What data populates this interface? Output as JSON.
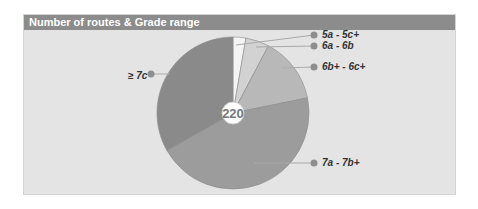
{
  "header": {
    "title": "Number of routes & Grade range"
  },
  "center_total": "220",
  "labels": {
    "s0": "5a - 5c+",
    "s1": "6a - 6b",
    "s2": "6b+ - 6c+",
    "s3": "7a - 7b+",
    "s4": "≥ 7c"
  },
  "colors": {
    "header": "#8c8c8c",
    "panel": "#e4e4e4",
    "slices": [
      "#f4f4f4",
      "#d2d2d2",
      "#b8b8b8",
      "#9c9c9c",
      "#8a8a8a"
    ],
    "marker": "#8e8e8e"
  },
  "chart_data": {
    "type": "pie",
    "title": "Number of routes & Grade range",
    "total": 220,
    "categories": [
      "5a - 5c+",
      "6a - 6b",
      "6b+ - 6c+",
      "7a - 7b+",
      "≥ 7c"
    ],
    "values": [
      6,
      11,
      31,
      99,
      73
    ],
    "percent_estimate": [
      3,
      5,
      14,
      45,
      33
    ],
    "start_angle": "12 o'clock, clockwise",
    "legend_position": "callout labels"
  }
}
